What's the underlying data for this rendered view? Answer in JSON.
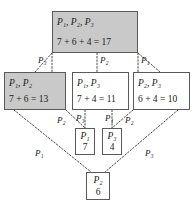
{
  "diagram": {
    "colors": {
      "shaded_fill": "#c9c9c9",
      "plain_fill": "#ffffff",
      "border": "#5a5a5a",
      "edge": "#4a4a4a",
      "text": "#1a1a1a"
    },
    "nodes": [
      {
        "id": "top",
        "set_label": "P₁, P₂, P₃",
        "sum_label": "7 + 6 + 4 = 17",
        "shaded": true
      },
      {
        "id": "p1p2",
        "set_label": "P₁, P₂",
        "sum_label": "7 + 6 = 13",
        "shaded": true
      },
      {
        "id": "p1p3",
        "set_label": "P₁, P₃",
        "sum_label": "7 + 4 = 11",
        "shaded": false
      },
      {
        "id": "p2p3",
        "set_label": "P₂, P₃",
        "sum_label": "6 + 4 = 10",
        "shaded": false
      },
      {
        "id": "p1",
        "set_label": "P₁",
        "sum_label": "7",
        "shaded": false
      },
      {
        "id": "p3",
        "set_label": "P₃",
        "sum_label": "4",
        "shaded": false
      },
      {
        "id": "p2",
        "set_label": "P₂",
        "sum_label": "6",
        "shaded": false
      }
    ],
    "edge_labels": [
      {
        "id": "top-to-p1p2",
        "label": "P₃"
      },
      {
        "id": "top-to-p1p3",
        "label": "P₂"
      },
      {
        "id": "top-to-p2p3",
        "label": "P₁"
      },
      {
        "id": "p1p2-to-p1",
        "label": "P₂"
      },
      {
        "id": "p1p3-to-p1",
        "label": "P₃"
      },
      {
        "id": "p1p3-to-p3",
        "label": "P₁"
      },
      {
        "id": "p2p3-to-p3",
        "label": "P₂"
      },
      {
        "id": "p1p2-to-p2",
        "label": "P₁"
      },
      {
        "id": "p2p3-to-p2",
        "label": "P₃"
      }
    ]
  }
}
